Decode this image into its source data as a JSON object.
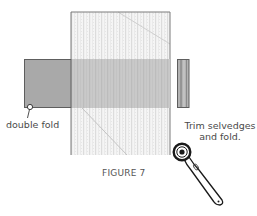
{
  "figure": {
    "caption": "FIGURE 7",
    "labels": {
      "double_fold": "double fold",
      "trim_line1": "Trim selvedges",
      "trim_line2": "and fold."
    },
    "colors": {
      "background": "#ffffff",
      "fabric_light": "#f4f4f4",
      "fabric_stripe": "#e2e2e2",
      "fabric_band": "#c8c8c8",
      "fold_dark": "#a8a8a8",
      "outline": "#6e6e6e",
      "text": "#4a4a4a",
      "cutter": "#1a1a1a"
    },
    "icons": {
      "rotary_cutter": "rotary-cutter-icon",
      "fold_marker": "circle-marker-icon"
    }
  }
}
